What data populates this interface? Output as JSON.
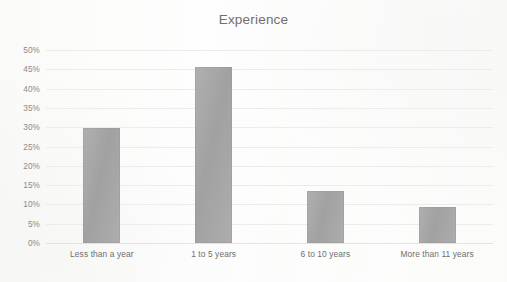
{
  "chart_data": {
    "type": "bar",
    "title": "Experience",
    "xlabel": "",
    "ylabel": "",
    "categories": [
      "Less than a year",
      "1 to 5 years",
      "6 to 10 years",
      "More than 11 years"
    ],
    "values": [
      29.8,
      45.6,
      13.4,
      9.3
    ],
    "value_labels": [
      "30%",
      "45%",
      "13%",
      "9%"
    ],
    "ylim": [
      0,
      50
    ],
    "ytick_values": [
      0,
      5,
      10,
      15,
      20,
      25,
      30,
      35,
      40,
      45,
      50
    ],
    "ytick_labels": [
      "0%",
      "5%",
      "10%",
      "15%",
      "20%",
      "25%",
      "30%",
      "35%",
      "40%",
      "45%",
      "50%"
    ],
    "grid": true,
    "legend": false,
    "legend_position": "none",
    "bar_color": "#a7a7a7",
    "gridline_color": "#ececed",
    "title_color": "#6f6f6f",
    "tick_label_color": "#8a8a8a",
    "background_color": "#fdfdfc"
  }
}
